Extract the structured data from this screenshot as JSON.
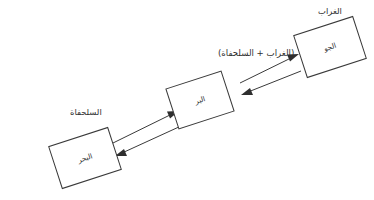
{
  "diagram": {
    "title_text": "",
    "background_color": "#ffffff",
    "stroke_color": "#3a3a3a",
    "text_color": "#2f2f2f",
    "nodes": [
      {
        "id": "air",
        "label": "الجو",
        "cx": 330,
        "cy": 47,
        "w": 62,
        "h": 44,
        "rotation": -18
      },
      {
        "id": "land",
        "label": "البر",
        "cx": 200,
        "cy": 100,
        "w": 58,
        "h": 42,
        "rotation": -18
      },
      {
        "id": "sea",
        "label": "البحر",
        "cx": 85,
        "cy": 158,
        "w": 62,
        "h": 44,
        "rotation": -18
      }
    ],
    "outer_labels": [
      {
        "id": "crow",
        "text": "الغراب",
        "x": 330,
        "y": 14
      },
      {
        "id": "turtle",
        "text": "السلحفاة",
        "x": 70,
        "y": 115
      }
    ],
    "combo_label": {
      "id": "crow-plus-turtle",
      "text": "(الغراب + السلحفاة)",
      "x": 218,
      "y": 56
    },
    "connectors": [
      {
        "id": "land-to-air",
        "from": "land",
        "to": "air",
        "direction": "up-right",
        "line": {
          "x1": 240,
          "y1": 83,
          "x2": 296,
          "y2": 56
        },
        "head_at": "end"
      },
      {
        "id": "air-to-land",
        "from": "air",
        "to": "land",
        "direction": "down-left",
        "line": {
          "x1": 300,
          "y1": 70,
          "x2": 244,
          "y2": 92
        },
        "head_at": "end"
      },
      {
        "id": "sea-to-land",
        "from": "sea",
        "to": "land",
        "direction": "up-right",
        "line": {
          "x1": 115,
          "y1": 142,
          "x2": 176,
          "y2": 112
        },
        "head_at": "end"
      },
      {
        "id": "land-to-sea",
        "from": "land",
        "to": "sea",
        "direction": "down-left",
        "line": {
          "x1": 180,
          "y1": 125,
          "x2": 120,
          "y2": 152
        },
        "head_at": "end"
      }
    ]
  }
}
